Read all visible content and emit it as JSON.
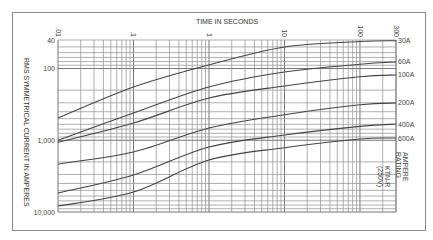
{
  "chart_data": {
    "type": "line",
    "title": "",
    "xlabel": "TIME IN SECONDS",
    "ylabel": "RMS SYMMETRICAL CURRENT IN AMPERES",
    "x_scale": "log",
    "y_scale": "log",
    "y_inverted": true,
    "xlim": [
      0.1,
      300
    ],
    "ylim": [
      40,
      10000
    ],
    "x_ticks": [
      {
        "value": 0.1,
        "label": ".01"
      },
      {
        "value": 1,
        "label": ".1"
      },
      {
        "value": 10,
        "label": "1"
      },
      {
        "value": 100,
        "label": "10"
      },
      {
        "value": 1000,
        "label": "100"
      },
      {
        "value": 3000,
        "label": "300"
      }
    ],
    "y_ticks": [
      {
        "value": 40,
        "label": "40"
      },
      {
        "value": 100,
        "label": "100"
      },
      {
        "value": 1000,
        "label": "1,000"
      },
      {
        "value": 10000,
        "label": "10,000"
      }
    ],
    "grid": true,
    "legend_title": "AMPERE RATING",
    "annotation": "KTN-R (250V)",
    "x": [
      0.1,
      1,
      10,
      100,
      1000,
      3000
    ],
    "series": [
      {
        "name": "30A",
        "values": [
          490,
          181,
          89,
          50,
          42,
          41
        ]
      },
      {
        "name": "60A",
        "values": [
          1000,
          417,
          181,
          112,
          87,
          81
        ]
      },
      {
        "name": "100A",
        "values": [
          1070,
          575,
          258,
          175,
          130,
          123
        ]
      },
      {
        "name": "200A",
        "values": [
          2140,
          1460,
          675,
          440,
          320,
          302
        ]
      },
      {
        "name": "400A",
        "values": [
          5440,
          3050,
          1243,
          845,
          640,
          594
        ]
      },
      {
        "name": "600A",
        "values": [
          8270,
          5270,
          1887,
          1270,
          960,
          931
        ]
      }
    ]
  },
  "labels": {
    "x_axis_title": "TIME IN SECONDS",
    "y_axis_title": "RMS SYMMETRICAL CURRENT IN AMPERES",
    "legend_title_1": "AMPERE",
    "legend_title_2": "RATING",
    "annotation_1": "KTN-R",
    "annotation_2": "(250V)"
  }
}
